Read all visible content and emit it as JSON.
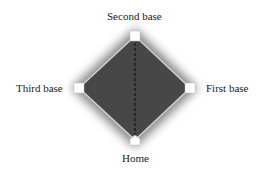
{
  "diagram": {
    "labels": {
      "second": "Second base",
      "first": "First base",
      "third": "Third base",
      "home": "Home"
    },
    "colors": {
      "field": "#4a4a4a",
      "glow": "#9a9a9a",
      "baseline": "#cfcfcf",
      "base": "#ffffff",
      "dashed_line": "#111111"
    }
  }
}
